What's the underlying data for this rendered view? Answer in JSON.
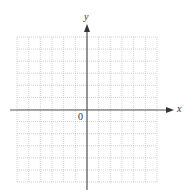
{
  "diagram": {
    "type": "blank coordinate grid",
    "x_axis_label": "x",
    "y_axis_label": "y",
    "origin_label": "0",
    "grid": {
      "columns": 12,
      "rows": 12,
      "left_px": 17,
      "right_px": 157,
      "top_px": 37,
      "bottom_px": 182,
      "line_style": "dotted",
      "line_color": "#bdbdbd"
    },
    "axes": {
      "color": "#555555",
      "x_axis_y_px": 110,
      "y_axis_x_px": 87,
      "x_axis_start_px": 10,
      "x_axis_arrow_tip_px": 174,
      "y_axis_arrow_tip_px": 24,
      "y_axis_end_px": 190
    }
  }
}
